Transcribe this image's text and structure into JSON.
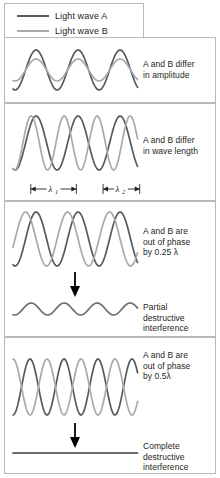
{
  "legend": {
    "items": [
      {
        "label": "Light wave A",
        "color": "#58595b"
      },
      {
        "label": "Light wave B",
        "color": "#a7a9ac"
      }
    ]
  },
  "panels": [
    {
      "id": "amplitude",
      "caption": "A and B differ\nin amplitude",
      "wave_a": {
        "amplitude": 20,
        "wavelength": 42,
        "phase": 0,
        "color": "#58595b"
      },
      "wave_b": {
        "amplitude": 11,
        "wavelength": 42,
        "phase": 0,
        "color": "#a7a9ac"
      }
    },
    {
      "id": "wavelength",
      "caption": "A and B differ\nin wave length",
      "wave_a": {
        "amplitude": 27,
        "wavelength": 42,
        "phase": 0,
        "color": "#58595b"
      },
      "wave_b": {
        "amplitude": 27,
        "wavelength": 33,
        "phase": 0,
        "color": "#a7a9ac"
      },
      "measures": [
        {
          "label": "λ",
          "sub": "1",
          "width": 42
        },
        {
          "label": "λ",
          "sub": "2",
          "width": 33
        }
      ]
    },
    {
      "id": "phase-quarter",
      "caption": "A and B are\nout of phase\nby 0.25 λ",
      "wave_a": {
        "amplitude": 27,
        "wavelength": 42,
        "phase": 0,
        "color": "#58595b"
      },
      "wave_b": {
        "amplitude": 27,
        "wavelength": 42,
        "phase": 0.25,
        "color": "#a7a9ac"
      },
      "arrow": "down-arrow",
      "result": {
        "caption": "Partial\ndestructive\ninterference",
        "amplitude": 6,
        "wavelength": 33,
        "color": "#6d6e71"
      }
    },
    {
      "id": "phase-half",
      "caption": "A and B are\nout of phase\nby 0.5λ",
      "wave_a": {
        "amplitude": 28,
        "wavelength": 34,
        "phase": 0,
        "color": "#58595b"
      },
      "wave_b": {
        "amplitude": 28,
        "wavelength": 34,
        "phase": 0.5,
        "color": "#a7a9ac"
      },
      "arrow": "down-arrow",
      "result": {
        "caption": "Complete\ndestructive\ninterference",
        "amplitude": 0,
        "wavelength": 34,
        "color": "#6d6e71"
      }
    }
  ]
}
